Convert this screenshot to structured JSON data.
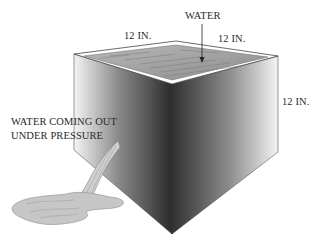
{
  "diagram": {
    "labels": {
      "water": "WATER",
      "width_dimension": "12 IN.",
      "depth_dimension": "12 IN.",
      "height_dimension": "12 IN.",
      "leak_line1": "WATER COMING OUT",
      "leak_line2": "UNDER PRESSURE"
    },
    "colors": {
      "face_dark": "#2e2e2e",
      "face_light": "#f2f2f2",
      "water_surface": "#9a9a9a",
      "puddle": "#bdbdbd",
      "text": "#2a2a2a"
    }
  }
}
